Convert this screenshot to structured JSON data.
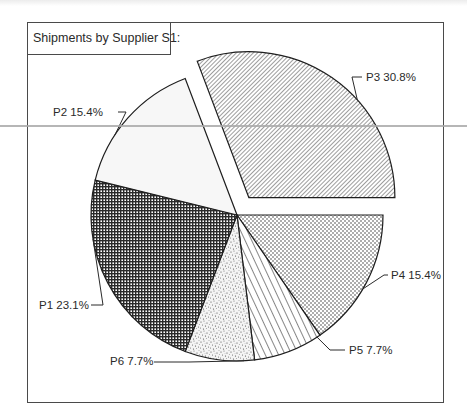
{
  "chart_data": {
    "type": "pie",
    "title": "Shipments by Supplier S1:",
    "categories": [
      "P4",
      "P5",
      "P6",
      "P1",
      "P2",
      "P3"
    ],
    "values": [
      15.4,
      7.7,
      7.7,
      23.1,
      15.4,
      30.8
    ],
    "unit": "%",
    "exploded": [
      "P3"
    ],
    "start_angle_deg": 0,
    "direction": "clockwise",
    "legend": "none (inline labels)",
    "slices": [
      {
        "name": "P4",
        "value": 15.4,
        "label": "P4 15.4%",
        "pattern": "fine-dots"
      },
      {
        "name": "P5",
        "value": 7.7,
        "label": "P5 7.7%",
        "pattern": "diagonal-lines-wide"
      },
      {
        "name": "P6",
        "value": 7.7,
        "label": "P6 7.7%",
        "pattern": "random-stipple"
      },
      {
        "name": "P1",
        "value": 23.1,
        "label": "P1 23.1%",
        "pattern": "dense-crosshatch"
      },
      {
        "name": "P2",
        "value": 15.4,
        "label": "P2 15.4%",
        "pattern": "blank"
      },
      {
        "name": "P3",
        "value": 30.8,
        "label": "P3 30.8%",
        "pattern": "fine-diagonal-hatch"
      }
    ]
  },
  "colors": {
    "ink": "#2a2a2a",
    "frame": "#4a4a4a",
    "background": "#ffffff",
    "p2_fill": "#f7f7f7"
  }
}
